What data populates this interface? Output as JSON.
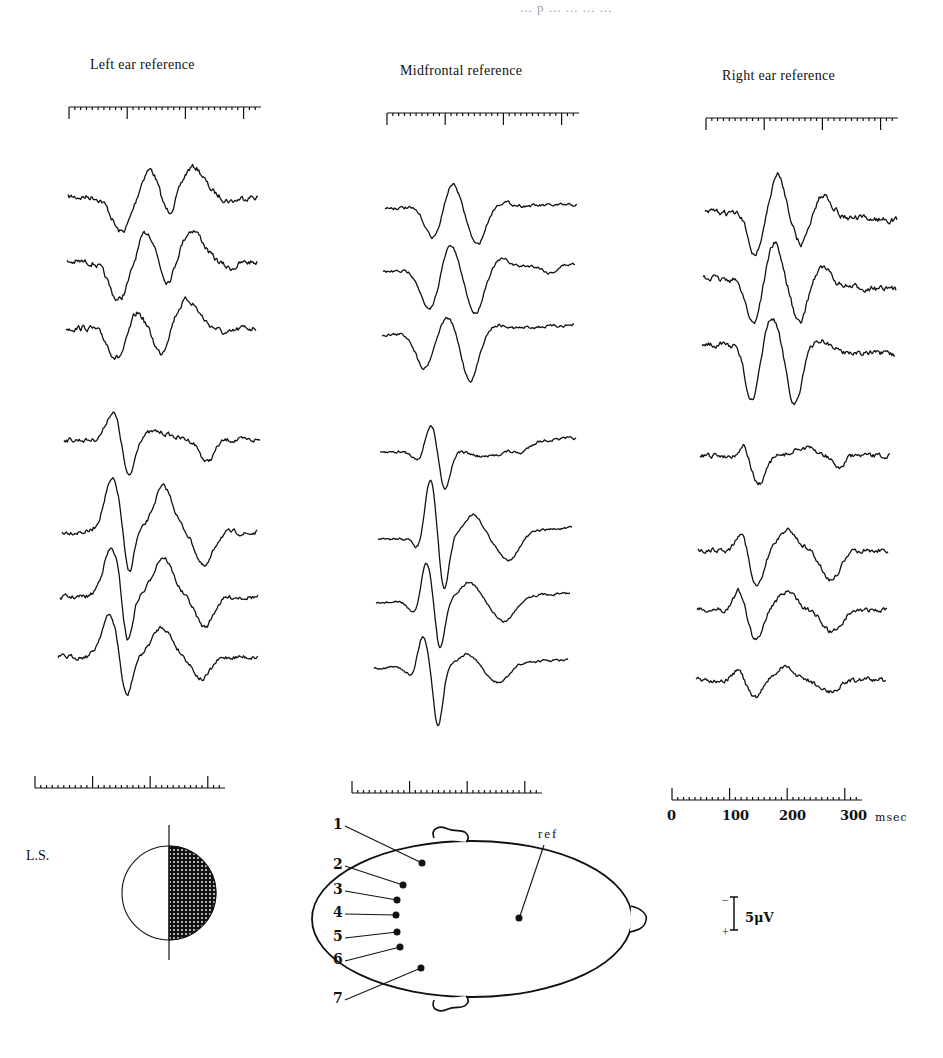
{
  "page_header": "... p ... ... ... ...",
  "columns": [
    {
      "title": "Left ear reference"
    },
    {
      "title": "Midfrontal reference"
    },
    {
      "title": "Right ear reference"
    }
  ],
  "time_axis": {
    "ticks": [
      "0",
      "100",
      "200",
      "300"
    ],
    "unit": "msec"
  },
  "voltage_scale": {
    "minus": "−",
    "plus": "+",
    "label": "5μV"
  },
  "stimulus_label": "L.S.",
  "head_diagram": {
    "electrode_labels": [
      "1",
      "2",
      "3",
      "4",
      "5",
      "6",
      "7"
    ],
    "reference_label": "ref"
  },
  "chart_data": {
    "type": "line",
    "panels": [
      "Left ear reference",
      "Midfrontal reference",
      "Right ear reference"
    ],
    "traces_per_panel": 7,
    "trace_labels": [
      "1",
      "2",
      "3",
      "4",
      "5",
      "6",
      "7"
    ],
    "xlabel": "msec",
    "x_ticks": [
      0,
      100,
      200,
      300
    ],
    "xlim": [
      0,
      320
    ],
    "ylabel": "μV",
    "y_scale_bar": 5,
    "polarity": "negative up",
    "grid": false
  }
}
